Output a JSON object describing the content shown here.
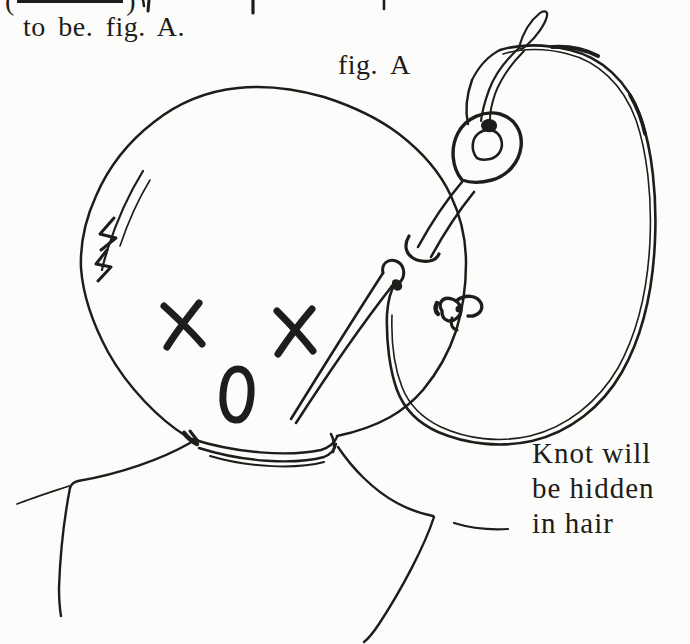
{
  "page": {
    "paper_color": "#fcfcfa",
    "ink_color": "#1d1d1b",
    "kind": "scanned-book-page-with-hand-drawn-figure"
  },
  "text": {
    "clipped_top_line": {
      "open_paren": "(",
      "close_paren": ")"
    },
    "body_line": "to be. fig. A.",
    "figure_caption": "fig. A",
    "annotation_lines": [
      "Knot will",
      "be hidden",
      "in hair"
    ]
  },
  "figure": {
    "parts": [
      "head-outline",
      "x-eyes",
      "o-mouth",
      "needle",
      "needle-eye",
      "thread-loop",
      "thread-knot",
      "neck-collar",
      "shoulders"
    ]
  }
}
